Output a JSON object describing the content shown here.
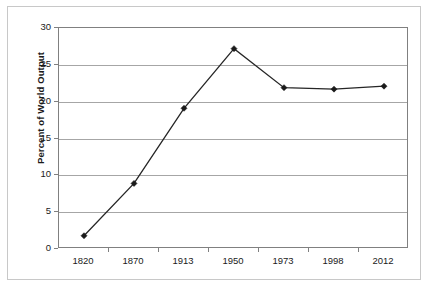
{
  "chart_data": {
    "type": "line",
    "title": "",
    "subtitle": "",
    "xlabel": "",
    "ylabel": "Percent of World Output",
    "categories": [
      "1820",
      "1870",
      "1913",
      "1950",
      "1973",
      "1998",
      "2012"
    ],
    "values": [
      1.8,
      8.9,
      19.1,
      27.2,
      21.9,
      21.7,
      22.1
    ],
    "series": [
      {
        "name": "Percent of World Output",
        "values": [
          1.8,
          8.9,
          19.1,
          27.2,
          21.9,
          21.7,
          22.1
        ]
      }
    ],
    "ylim": [
      0,
      30
    ],
    "ytick_labels": [
      "0",
      "5",
      "10",
      "15",
      "20",
      "25",
      "30"
    ],
    "ytick_values": [
      0,
      5,
      10,
      15,
      20,
      25,
      30
    ],
    "grid": "horizontal",
    "legend": "none",
    "marker": "diamond",
    "line_color": "#262626",
    "marker_color": "#1a1a1a",
    "gridline_color": "#a6a6a6",
    "axis_color": "#808080",
    "background_color": "#ffffff"
  }
}
